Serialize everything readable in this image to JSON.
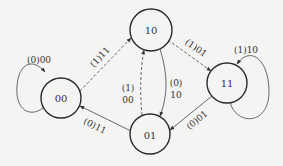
{
  "diagram": {
    "type": "state-transition-diagram",
    "states": [
      {
        "id": "s10",
        "label": "10"
      },
      {
        "id": "s00",
        "label": "00"
      },
      {
        "id": "s11",
        "label": "11"
      },
      {
        "id": "s01",
        "label": "01"
      }
    ],
    "transitions": [
      {
        "from": "00",
        "to": "00",
        "style": "solid",
        "label": "(0)00"
      },
      {
        "from": "00",
        "to": "10",
        "style": "dashed",
        "label": "(1)11"
      },
      {
        "from": "10",
        "to": "11",
        "style": "dashed",
        "label": "(1)01"
      },
      {
        "from": "11",
        "to": "11",
        "style": "solid",
        "label": "(1)10"
      },
      {
        "from": "10",
        "to": "01",
        "style": "solid",
        "label_line1": "(0)",
        "label_line2": "10"
      },
      {
        "from": "01",
        "to": "10",
        "style": "dashed",
        "label_line1": "(1)",
        "label_line2": "00"
      },
      {
        "from": "11",
        "to": "01",
        "style": "solid",
        "label": "(0)01"
      },
      {
        "from": "01",
        "to": "00",
        "style": "solid",
        "label": "(0)11"
      }
    ],
    "colors": {
      "background": "#f4f4f2",
      "stroke": "#2a2a2a",
      "text": "#333333"
    }
  }
}
